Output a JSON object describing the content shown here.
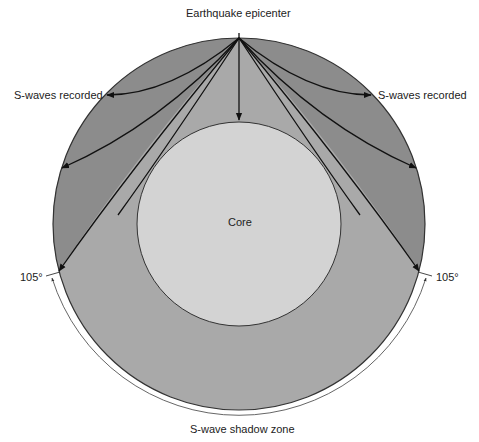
{
  "labels": {
    "epicenter": "Earthquake epicenter",
    "s_waves_left": "S-waves recorded",
    "s_waves_right": "S-waves recorded",
    "core": "Core",
    "angle_left": "105°",
    "angle_right": "105°",
    "shadow_zone": "S-wave shadow zone"
  },
  "colors": {
    "background": "#ffffff",
    "mantle_recorded": "#8c8c8c",
    "mantle_shadow": "#a9a9a9",
    "core": "#d3d3d3",
    "outline": "#333333",
    "rays": "#111111"
  },
  "geometry": {
    "earth_center": [
      239,
      224
    ],
    "earth_radius": 186,
    "core_radius": 102,
    "shadow_angle_deg": 105
  }
}
